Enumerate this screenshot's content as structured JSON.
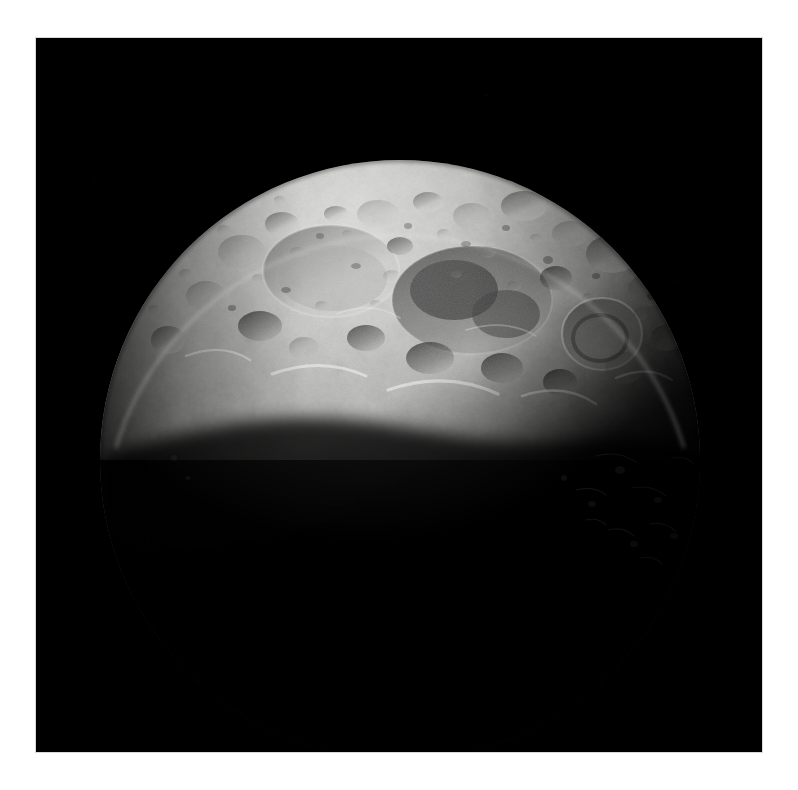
{
  "image": {
    "kind": "astronomical-photograph",
    "subject": "cratered airless rocky body, sunlit crescent at top, terminator across middle, night side in shadow",
    "frame": {
      "page_width": 798,
      "page_height": 790,
      "matte_color": "#ffffff",
      "plate_left": 36,
      "plate_top": 38,
      "plate_width": 726,
      "plate_height": 714,
      "sky_color": "#000000",
      "plate_border_color": "#d8d8d8"
    },
    "body": {
      "center_x": 364,
      "center_y": 422,
      "radius": 300,
      "limb_top_y": 132,
      "limb_left_x": 64,
      "limb_right_x": 666,
      "highlight_color": "#d2d2d0",
      "midtone_color": "#8e8e8c",
      "shadow_color": "#2a2a29",
      "night_color": "#050505"
    },
    "terminator": {
      "description": "illumination boundary running from lower-left limb up and across to the lower-right limb",
      "left_anchor_x": 70,
      "left_anchor_y": 430,
      "right_anchor_x": 660,
      "right_anchor_y": 400
    },
    "features": [
      {
        "name": "large-degraded-basin",
        "cx": 295,
        "cy": 230,
        "rx": 66,
        "ry": 44,
        "tone": "#9a9a97"
      },
      {
        "name": "shadowed-crater-complex",
        "cx": 430,
        "cy": 255,
        "rx": 78,
        "ry": 52,
        "tone": "#5a5a58"
      },
      {
        "name": "bright-rim-crater-right",
        "cx": 565,
        "cy": 295,
        "rx": 38,
        "ry": 34,
        "tone": "#7e7e7c"
      },
      {
        "name": "small-crater-field-top",
        "cx": 400,
        "cy": 175,
        "rx": 140,
        "ry": 40,
        "tone": "#b9b9b6"
      },
      {
        "name": "bright-limb-highlight",
        "cx": 330,
        "cy": 150,
        "rx": 170,
        "ry": 32,
        "tone": "#cfcfcd"
      }
    ]
  },
  "overlay": {
    "has_text": false,
    "has_annotations": false,
    "has_scale_bar": false,
    "caption": ""
  }
}
